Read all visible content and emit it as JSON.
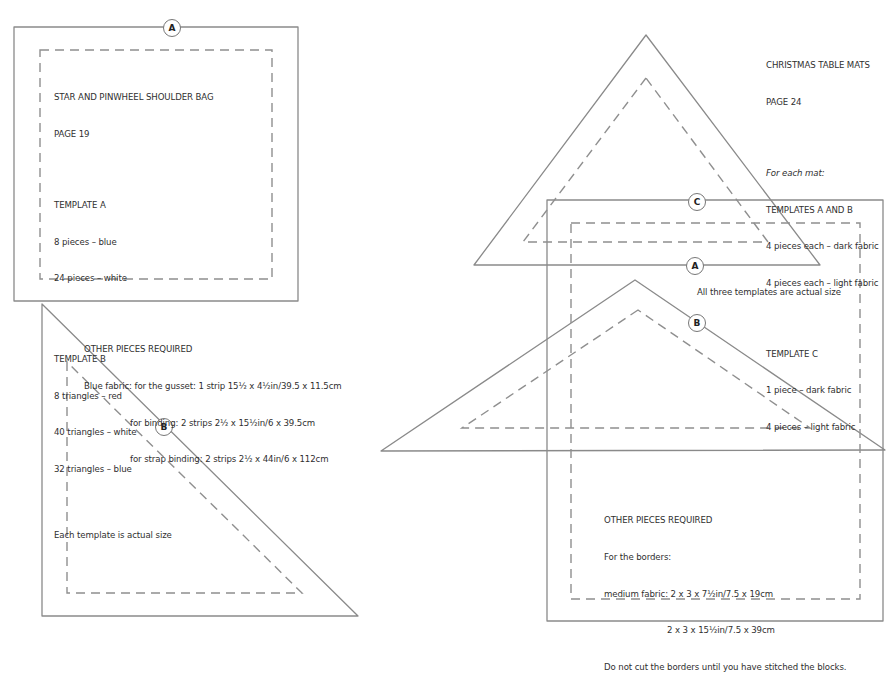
{
  "left_section": {
    "template_a_label": "A",
    "template_b_label": "B",
    "project_title": "STAR AND PINWHEEL SHOULDER BAG",
    "page": "PAGE 19",
    "template_a": {
      "heading": "TEMPLATE A",
      "items": [
        "8 pieces – blue",
        "24 pieces – white"
      ]
    },
    "template_b": {
      "heading": "TEMPLATE B",
      "items": [
        "8 triangles – red",
        "40 triangles – white",
        "32 triangles – blue"
      ]
    },
    "note": "Each template is actual size",
    "other_pieces": {
      "heading": "OTHER PIECES REQUIRED",
      "lines": [
        "Blue fabric: for the gusset: 1 strip 15½ x 4½in/39.5 x 11.5cm",
        "for binding: 2 strips 2½ x 15½in/6 x 39.5cm",
        "for strap binding: 2 strips 2½ x 44in/6 x 112cm"
      ]
    }
  },
  "right_section": {
    "template_a_label": "A",
    "template_b_label": "B",
    "template_c_label": "C",
    "project_title": "CHRISTMAS TABLE MATS",
    "page": "PAGE 24",
    "for_each": "For each mat:",
    "templates_ab": {
      "heading": "TEMPLATES A AND B",
      "items": [
        "4 pieces each – dark fabric",
        "4 pieces each – light fabric"
      ]
    },
    "template_c": {
      "heading": "TEMPLATE C",
      "items": [
        "1 piece – dark fabric",
        "4 pieces – light fabric"
      ]
    },
    "note": "All three templates are actual size",
    "other_pieces": {
      "heading": "OTHER PIECES REQUIRED",
      "lines": [
        "For the borders:",
        "medium fabric: 2 x 3 x 7½in/7.5 x 19cm",
        "2 x 3 x 15½in/7.5 x 39cm",
        "Do not cut the borders until you have stitched the blocks."
      ]
    }
  },
  "colors": {
    "cut_line": "#8a8a8a",
    "seam_line": "#8f8f8f",
    "text": "#2f2f2f",
    "background": "#ffffff"
  }
}
